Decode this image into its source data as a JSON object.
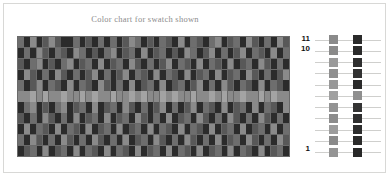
{
  "figure": {
    "title": "Color chart for swatch shown",
    "title_color": "#8c8c8c",
    "frame_color": "#d8d8d6",
    "background": "#ffffff"
  },
  "axis": {
    "row_labels": [
      {
        "name": "row-label-11",
        "text": "11"
      },
      {
        "name": "row-label-10",
        "text": "10"
      },
      {
        "name": "row-label-1",
        "text": "1"
      }
    ],
    "label_color": "#111111"
  },
  "chart_data": {
    "type": "heatmap",
    "title": "Color chart for swatch shown",
    "xlabel": "",
    "ylabel": "",
    "columns": 44,
    "rows": 11,
    "grid": true,
    "grid_line_color": "#6a6a6a",
    "legend_position": "right",
    "palette": {
      "0": "#2b2b2b",
      "1": "#3d3d3d",
      "2": "#585858",
      "3": "#6e6e6e",
      "4": "#8a8a8a",
      "5": "#a3a3a3"
    },
    "tick_labels_y": [
      "11",
      "10",
      "1"
    ],
    "values": [
      [
        3,
        0,
        4,
        0,
        2,
        4,
        2,
        0,
        0,
        3,
        0,
        2,
        0,
        3,
        0,
        3,
        0,
        2,
        4,
        3,
        0,
        2,
        0,
        3,
        2,
        0,
        4,
        0,
        3,
        2,
        0,
        3,
        4,
        0,
        2,
        3,
        0,
        4,
        2,
        0,
        3,
        0,
        4,
        2
      ],
      [
        0,
        3,
        0,
        4,
        2,
        0,
        3,
        2,
        0,
        4,
        3,
        0,
        2,
        0,
        3,
        4,
        0,
        2,
        3,
        0,
        4,
        0,
        2,
        3,
        0,
        2,
        0,
        4,
        3,
        0,
        2,
        4,
        0,
        3,
        0,
        2,
        4,
        0,
        3,
        2,
        0,
        4,
        0,
        3
      ],
      [
        2,
        0,
        3,
        4,
        0,
        2,
        0,
        3,
        4,
        0,
        2,
        3,
        0,
        4,
        0,
        2,
        3,
        0,
        4,
        2,
        0,
        3,
        0,
        2,
        4,
        0,
        3,
        2,
        0,
        4,
        0,
        3,
        2,
        0,
        4,
        0,
        2,
        3,
        0,
        4,
        2,
        0,
        3,
        0
      ],
      [
        0,
        4,
        2,
        0,
        3,
        0,
        4,
        2,
        0,
        3,
        0,
        2,
        4,
        0,
        3,
        0,
        2,
        4,
        0,
        3,
        2,
        0,
        4,
        0,
        3,
        2,
        0,
        4,
        0,
        2,
        3,
        0,
        4,
        0,
        2,
        3,
        0,
        4,
        2,
        0,
        3,
        0,
        2,
        4
      ],
      [
        3,
        0,
        2,
        4,
        0,
        3,
        2,
        0,
        4,
        0,
        3,
        2,
        0,
        4,
        2,
        0,
        3,
        0,
        4,
        0,
        2,
        3,
        0,
        4,
        0,
        2,
        3,
        0,
        2,
        4,
        0,
        3,
        0,
        4,
        2,
        0,
        3,
        2,
        0,
        4,
        0,
        3,
        2,
        0
      ],
      [
        4,
        4,
        5,
        4,
        5,
        4,
        4,
        5,
        4,
        4,
        5,
        4,
        5,
        4,
        4,
        5,
        4,
        4,
        5,
        4,
        5,
        4,
        4,
        5,
        4,
        5,
        4,
        4,
        5,
        4,
        4,
        5,
        4,
        5,
        4,
        4,
        5,
        4,
        4,
        5,
        4,
        5,
        4,
        4
      ],
      [
        0,
        3,
        4,
        0,
        2,
        0,
        3,
        4,
        0,
        2,
        3,
        0,
        4,
        0,
        2,
        3,
        0,
        4,
        2,
        0,
        3,
        0,
        2,
        4,
        0,
        3,
        0,
        2,
        4,
        0,
        3,
        2,
        0,
        4,
        0,
        2,
        3,
        0,
        4,
        0,
        3,
        2,
        0,
        4
      ],
      [
        2,
        0,
        3,
        0,
        4,
        2,
        0,
        3,
        0,
        4,
        0,
        2,
        3,
        0,
        4,
        0,
        2,
        3,
        0,
        4,
        2,
        0,
        3,
        0,
        4,
        0,
        2,
        3,
        0,
        4,
        2,
        0,
        3,
        0,
        4,
        2,
        0,
        3,
        0,
        4,
        2,
        0,
        3,
        0
      ],
      [
        0,
        4,
        0,
        3,
        2,
        0,
        4,
        0,
        3,
        2,
        0,
        4,
        0,
        2,
        3,
        0,
        4,
        0,
        2,
        3,
        0,
        4,
        0,
        3,
        2,
        0,
        4,
        0,
        3,
        2,
        0,
        4,
        0,
        2,
        3,
        0,
        4,
        0,
        2,
        3,
        0,
        4,
        0,
        3
      ],
      [
        3,
        0,
        4,
        2,
        0,
        3,
        0,
        4,
        2,
        0,
        3,
        0,
        4,
        2,
        0,
        3,
        0,
        4,
        0,
        2,
        3,
        0,
        4,
        2,
        0,
        3,
        0,
        4,
        2,
        0,
        3,
        0,
        4,
        0,
        2,
        3,
        0,
        4,
        2,
        0,
        3,
        0,
        4,
        2
      ],
      [
        0,
        2,
        3,
        0,
        4,
        0,
        2,
        3,
        0,
        4,
        0,
        3,
        2,
        0,
        4,
        0,
        3,
        2,
        0,
        4,
        0,
        2,
        3,
        0,
        4,
        0,
        3,
        2,
        0,
        4,
        0,
        2,
        3,
        0,
        4,
        0,
        3,
        2,
        0,
        4,
        0,
        2,
        3,
        0
      ]
    ]
  },
  "swatch_legend": {
    "name": "swatch-legend",
    "rule_color": "#cfcfcd",
    "rows": [
      {
        "a": "#8a8a8a",
        "b": "#2b2b2b"
      },
      {
        "a": "#8a8a8a",
        "b": "#2b2b2b"
      },
      {
        "a": "#9a9a9a",
        "b": "#2f2f2f"
      },
      {
        "a": "#8f8f8f",
        "b": "#333333"
      },
      {
        "a": "#989898",
        "b": "#2b2b2b"
      },
      {
        "a": "#a0a0a0",
        "b": "#8f8f8f"
      },
      {
        "a": "#939393",
        "b": "#343434"
      },
      {
        "a": "#8c8c8c",
        "b": "#303030"
      },
      {
        "a": "#9c9c9c",
        "b": "#2e2e2e"
      },
      {
        "a": "#8a8a8a",
        "b": "#2b2b2b"
      },
      {
        "a": "#949494",
        "b": "#282828"
      }
    ]
  }
}
